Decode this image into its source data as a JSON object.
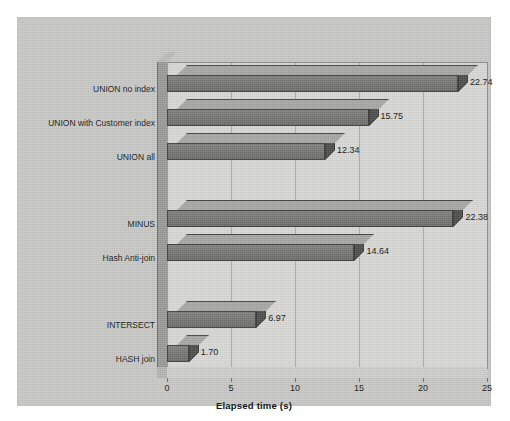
{
  "chart_data": {
    "type": "bar",
    "orientation": "horizontal",
    "title": "",
    "xlabel": "Elapsed time (s)",
    "ylabel": "",
    "xlim": [
      0,
      25
    ],
    "xticks": [
      0,
      5,
      10,
      15,
      20,
      25
    ],
    "xtick_labels": [
      "0",
      "5",
      "10",
      "15",
      "20",
      "25"
    ],
    "grid": true,
    "legend": false,
    "style": "3d-bar-grayscale",
    "categories": [
      "UNION no index",
      "UNION with Customer index",
      "UNION all",
      "MINUS",
      "Hash Anti-join",
      "INTERSECT",
      "HASH join"
    ],
    "values": [
      22.74,
      15.75,
      12.34,
      22.38,
      14.64,
      6.97,
      1.7
    ],
    "value_labels": [
      "22.74",
      "15.75",
      "12.34",
      "22.38",
      "14.64",
      "6.97",
      "1.70"
    ],
    "bars": [
      {
        "label": "UNION no index",
        "value": 22.74,
        "value_label": "22.74",
        "top": 3,
        "group": 0
      },
      {
        "label": "UNION with Customer index",
        "value": 15.75,
        "value_label": "15.75",
        "top": 37,
        "group": 0
      },
      {
        "label": "UNION all",
        "value": 12.34,
        "value_label": "12.34",
        "top": 71,
        "group": 0
      },
      {
        "label": "MINUS",
        "value": 22.38,
        "value_label": "22.38",
        "top": 138,
        "group": 1
      },
      {
        "label": "Hash Anti-join",
        "value": 14.64,
        "value_label": "14.64",
        "top": 172,
        "group": 1
      },
      {
        "label": "INTERSECT",
        "value": 6.97,
        "value_label": "6.97",
        "top": 239,
        "group": 2
      },
      {
        "label": "HASH join",
        "value": 1.7,
        "value_label": "1.70",
        "top": 273,
        "group": 2
      }
    ],
    "colors": {
      "page_background": "#ffffff",
      "canvas_background": "#c9c9c7",
      "plot_background": "#d9d9d7",
      "gridline": "#a9a9a7",
      "bar_front": "#777775",
      "bar_top": "#a8a8a6",
      "bar_side": "#4f4f4d",
      "axis": "#6e6e6c",
      "text": "#1b1b1b"
    }
  }
}
